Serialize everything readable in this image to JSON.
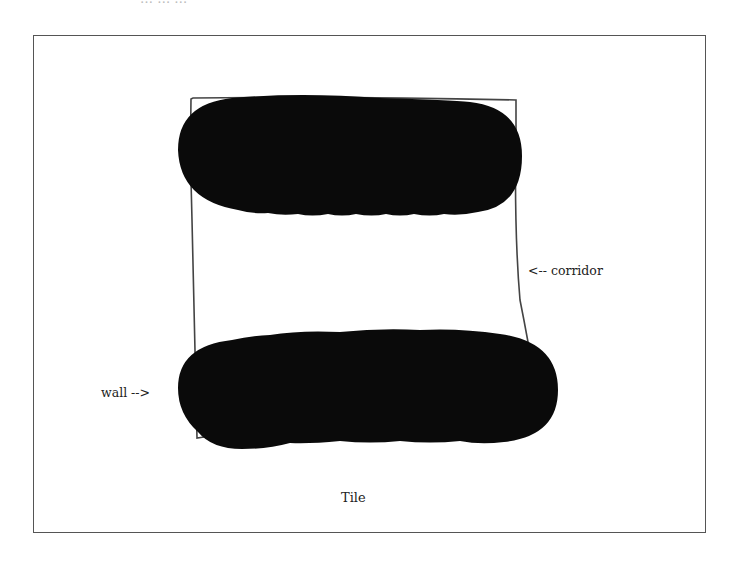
{
  "header": {
    "cut_off_text": "…  …  …"
  },
  "figure": {
    "caption": "Tile",
    "annotations": {
      "corridor": "<-- corridor",
      "wall": "wall -->"
    },
    "colors": {
      "wall_fill": "#0a0a0a",
      "outline": "#444444",
      "frame": "#555555",
      "background": "#ffffff"
    },
    "elements": [
      {
        "name": "tile-outline",
        "type": "hand-drawn-quadrilateral"
      },
      {
        "name": "top-wall",
        "type": "filled-blob"
      },
      {
        "name": "bottom-wall",
        "type": "filled-blob"
      },
      {
        "name": "corridor",
        "type": "empty-region"
      }
    ]
  }
}
